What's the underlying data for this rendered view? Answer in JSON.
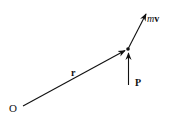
{
  "diagram": {
    "origin_label": "O",
    "position_vector_label": "r",
    "force_label": "P",
    "momentum_label_m": "m",
    "momentum_label_v": "v",
    "stroke_color": "#111111",
    "background": "#ffffff"
  }
}
